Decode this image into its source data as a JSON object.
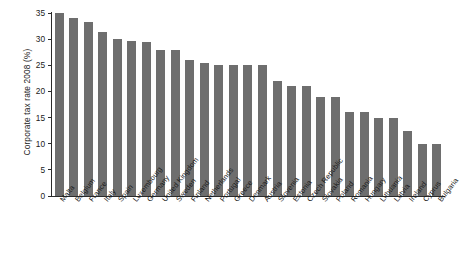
{
  "chart_data": {
    "type": "bar",
    "title": "",
    "xlabel": "",
    "ylabel": "Corporate tax rate 2008 (%)",
    "ylim": [
      0,
      35
    ],
    "yticks": [
      0,
      5,
      10,
      15,
      20,
      25,
      30,
      35
    ],
    "ytick_labels": [
      "0",
      "5",
      "10",
      "15",
      "20",
      "25",
      "30",
      "35"
    ],
    "grid": false,
    "legend": false,
    "bar_color": "#6e6e6e",
    "axis_color": "#2b2b2b",
    "categories": [
      "Malta",
      "Belgium",
      "France",
      "Italy",
      "Spain",
      "Luxembourg",
      "Germany",
      "United Kingdom",
      "Sweden",
      "Finland",
      "Netherlands",
      "Portugal",
      "Greece",
      "Denmark",
      "Austria",
      "Slovenia",
      "Estonia",
      "Czech Republic",
      "Slovakia",
      "Poland",
      "Romania",
      "Hungary",
      "Lithuania",
      "Latvia",
      "Ireland",
      "Cyprus",
      "Bulgaria"
    ],
    "values": [
      35.0,
      34.0,
      33.3,
      31.4,
      30.0,
      29.6,
      29.5,
      28.0,
      28.0,
      26.0,
      25.5,
      25.0,
      25.0,
      25.0,
      25.0,
      22.0,
      21.0,
      21.0,
      19.0,
      19.0,
      16.0,
      16.0,
      15.0,
      15.0,
      12.5,
      10.0,
      10.0
    ]
  }
}
